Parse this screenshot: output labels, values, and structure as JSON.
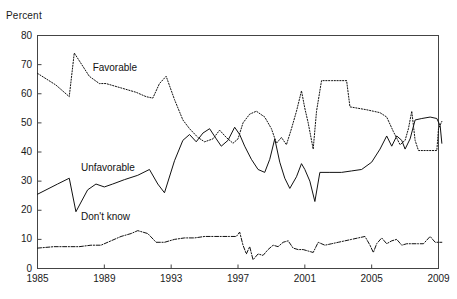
{
  "chart_data": {
    "type": "line",
    "title": "",
    "subtitle": "",
    "xlabel": "",
    "ylabel": "Percent",
    "xlim": [
      1985,
      2009
    ],
    "ylim": [
      0,
      80
    ],
    "grid": false,
    "legend_position": "inline-annotations",
    "x_ticks": [
      "1985",
      "1989",
      "1993",
      "1997",
      "2001",
      "2005",
      "2009"
    ],
    "x_tick_values": [
      1985,
      1989,
      1993,
      1997,
      2001,
      2005,
      2009
    ],
    "y_ticks": [
      "0",
      "10",
      "20",
      "30",
      "40",
      "50",
      "60",
      "70",
      "80"
    ],
    "y_tick_values": [
      0,
      10,
      20,
      30,
      40,
      50,
      60,
      70,
      80
    ],
    "series": [
      {
        "name": "Favorable",
        "style": "dotted",
        "color": "#111111",
        "label_x": 1988.3,
        "label_y": 68.5,
        "points": [
          [
            1985.0,
            67.0
          ],
          [
            1986.1,
            63.0
          ],
          [
            1986.9,
            59.0
          ],
          [
            1987.2,
            74.0
          ],
          [
            1988.1,
            66.0
          ],
          [
            1988.7,
            63.5
          ],
          [
            1989.1,
            63.5
          ],
          [
            1990.0,
            62.0
          ],
          [
            1990.9,
            60.5
          ],
          [
            1991.5,
            59.0
          ],
          [
            1991.9,
            58.5
          ],
          [
            1992.3,
            63.5
          ],
          [
            1992.7,
            66.0
          ],
          [
            1993.2,
            58.0
          ],
          [
            1993.7,
            51.0
          ],
          [
            1994.1,
            48.0
          ],
          [
            1994.6,
            45.0
          ],
          [
            1995.0,
            43.5
          ],
          [
            1995.5,
            44.5
          ],
          [
            1995.9,
            47.5
          ],
          [
            1996.3,
            45.0
          ],
          [
            1996.7,
            43.0
          ],
          [
            1997.0,
            44.5
          ],
          [
            1997.3,
            50.0
          ],
          [
            1997.7,
            53.0
          ],
          [
            1998.1,
            54.0
          ],
          [
            1998.6,
            52.0
          ],
          [
            1999.0,
            48.0
          ],
          [
            1999.3,
            43.0
          ],
          [
            1999.6,
            45.0
          ],
          [
            1999.9,
            42.5
          ],
          [
            2000.2,
            48.0
          ],
          [
            2000.5,
            54.0
          ],
          [
            2000.8,
            61.0
          ],
          [
            2001.0,
            55.0
          ],
          [
            2001.2,
            50.0
          ],
          [
            2001.5,
            41.0
          ],
          [
            2001.7,
            54.0
          ],
          [
            2002.0,
            64.5
          ],
          [
            2002.6,
            64.5
          ],
          [
            2003.2,
            64.5
          ],
          [
            2003.5,
            64.5
          ],
          [
            2003.7,
            55.5
          ],
          [
            2004.2,
            55.0
          ],
          [
            2004.7,
            54.5
          ],
          [
            2005.1,
            54.0
          ],
          [
            2005.5,
            53.5
          ],
          [
            2005.9,
            52.0
          ],
          [
            2006.3,
            47.0
          ],
          [
            2006.7,
            42.5
          ],
          [
            2007.0,
            44.0
          ],
          [
            2007.2,
            48.0
          ],
          [
            2007.4,
            54.0
          ],
          [
            2007.6,
            44.0
          ],
          [
            2007.8,
            40.5
          ],
          [
            2008.2,
            40.5
          ],
          [
            2008.6,
            40.5
          ],
          [
            2008.9,
            40.5
          ],
          [
            2009.0,
            48.0
          ],
          [
            2009.2,
            50.5
          ]
        ]
      },
      {
        "name": "Unfavorable",
        "style": "solid",
        "color": "#111111",
        "label_x": 1987.6,
        "label_y": 34.0,
        "points": [
          [
            1985.0,
            25.5
          ],
          [
            1986.2,
            29.0
          ],
          [
            1986.9,
            31.0
          ],
          [
            1987.3,
            19.5
          ],
          [
            1988.0,
            27.0
          ],
          [
            1988.5,
            29.0
          ],
          [
            1989.0,
            28.0
          ],
          [
            1989.5,
            29.0
          ],
          [
            1990.2,
            30.5
          ],
          [
            1991.0,
            32.0
          ],
          [
            1991.7,
            34.0
          ],
          [
            1992.2,
            29.0
          ],
          [
            1992.6,
            26.0
          ],
          [
            1993.2,
            37.0
          ],
          [
            1993.7,
            44.0
          ],
          [
            1994.1,
            46.0
          ],
          [
            1994.5,
            43.5
          ],
          [
            1994.9,
            46.5
          ],
          [
            1995.3,
            48.0
          ],
          [
            1995.7,
            44.5
          ],
          [
            1996.0,
            42.0
          ],
          [
            1996.4,
            44.0
          ],
          [
            1996.8,
            48.5
          ],
          [
            1997.1,
            46.0
          ],
          [
            1997.4,
            42.0
          ],
          [
            1997.8,
            37.5
          ],
          [
            1998.2,
            34.0
          ],
          [
            1998.6,
            33.0
          ],
          [
            1998.9,
            37.5
          ],
          [
            1999.2,
            44.5
          ],
          [
            1999.5,
            36.5
          ],
          [
            1999.8,
            31.0
          ],
          [
            2000.1,
            27.5
          ],
          [
            2000.5,
            31.5
          ],
          [
            2000.8,
            36.0
          ],
          [
            2001.0,
            34.0
          ],
          [
            2001.3,
            30.0
          ],
          [
            2001.6,
            23.0
          ],
          [
            2001.9,
            33.0
          ],
          [
            2002.5,
            33.0
          ],
          [
            2003.2,
            33.0
          ],
          [
            2003.8,
            33.5
          ],
          [
            2004.4,
            34.0
          ],
          [
            2005.0,
            36.5
          ],
          [
            2005.5,
            41.0
          ],
          [
            2005.9,
            45.5
          ],
          [
            2006.2,
            42.0
          ],
          [
            2006.5,
            45.5
          ],
          [
            2006.8,
            44.0
          ],
          [
            2007.0,
            41.0
          ],
          [
            2007.3,
            44.5
          ],
          [
            2007.6,
            51.0
          ],
          [
            2008.0,
            51.5
          ],
          [
            2008.5,
            52.0
          ],
          [
            2008.9,
            51.5
          ],
          [
            2009.1,
            49.0
          ],
          [
            2009.2,
            43.0
          ]
        ]
      },
      {
        "name": "Don't know",
        "style": "dash-dot",
        "color": "#111111",
        "label_x": 1987.6,
        "label_y": 17.5,
        "points": [
          [
            1985.0,
            7.0
          ],
          [
            1986.0,
            7.5
          ],
          [
            1986.8,
            7.5
          ],
          [
            1987.5,
            7.5
          ],
          [
            1988.2,
            8.0
          ],
          [
            1988.8,
            8.0
          ],
          [
            1989.4,
            9.5
          ],
          [
            1990.0,
            11.0
          ],
          [
            1990.6,
            12.0
          ],
          [
            1991.0,
            13.0
          ],
          [
            1991.6,
            12.0
          ],
          [
            1992.1,
            9.0
          ],
          [
            1992.6,
            9.0
          ],
          [
            1993.2,
            10.0
          ],
          [
            1993.8,
            10.5
          ],
          [
            1994.4,
            10.5
          ],
          [
            1995.0,
            11.0
          ],
          [
            1995.6,
            11.0
          ],
          [
            1996.0,
            11.0
          ],
          [
            1996.5,
            11.0
          ],
          [
            1996.9,
            11.0
          ],
          [
            1997.1,
            12.5
          ],
          [
            1997.3,
            8.0
          ],
          [
            1997.5,
            5.0
          ],
          [
            1997.7,
            7.5
          ],
          [
            1997.9,
            3.0
          ],
          [
            1998.2,
            5.0
          ],
          [
            1998.5,
            4.5
          ],
          [
            1998.8,
            6.5
          ],
          [
            1999.1,
            8.0
          ],
          [
            1999.4,
            7.5
          ],
          [
            1999.7,
            9.0
          ],
          [
            2000.0,
            9.5
          ],
          [
            2000.3,
            7.0
          ],
          [
            2000.6,
            6.5
          ],
          [
            2000.9,
            6.5
          ],
          [
            2001.2,
            6.0
          ],
          [
            2001.5,
            5.5
          ],
          [
            2001.8,
            9.0
          ],
          [
            2002.2,
            8.0
          ],
          [
            2002.6,
            8.5
          ],
          [
            2003.0,
            9.0
          ],
          [
            2003.4,
            9.5
          ],
          [
            2003.8,
            10.0
          ],
          [
            2004.2,
            10.5
          ],
          [
            2004.6,
            11.0
          ],
          [
            2004.9,
            8.0
          ],
          [
            2005.1,
            5.5
          ],
          [
            2005.3,
            8.5
          ],
          [
            2005.6,
            10.5
          ],
          [
            2005.9,
            8.5
          ],
          [
            2006.2,
            9.5
          ],
          [
            2006.5,
            10.0
          ],
          [
            2006.8,
            8.0
          ],
          [
            2007.1,
            8.5
          ],
          [
            2007.4,
            8.5
          ],
          [
            2007.8,
            8.5
          ],
          [
            2008.1,
            8.5
          ],
          [
            2008.5,
            11.0
          ],
          [
            2008.8,
            9.0
          ],
          [
            2009.2,
            9.0
          ]
        ]
      }
    ]
  }
}
